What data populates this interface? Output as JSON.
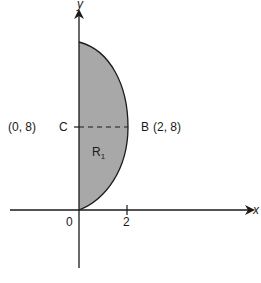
{
  "diagram": {
    "region_label": "R",
    "region_subscript": "1",
    "region_fill": "#a8a8a8",
    "stroke_color": "#1a1a1a",
    "axes": {
      "x_label": "x",
      "y_label": "y",
      "origin_label": "0",
      "x_tick_label": "2"
    },
    "points": {
      "C": {
        "name": "C",
        "coords": "(0, 8)"
      },
      "B": {
        "name": "B",
        "coords": "(2, 8)"
      }
    },
    "segment_CB": {
      "style": "dashed",
      "from": "C",
      "to": "B"
    }
  }
}
